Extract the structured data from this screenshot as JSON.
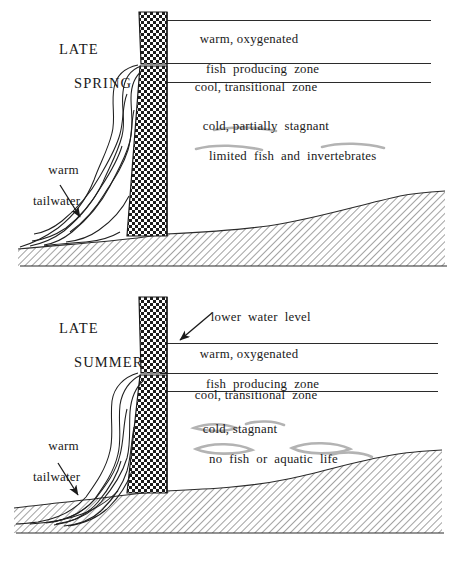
{
  "figure": {
    "colors": {
      "ink": "#1a1a1a",
      "line": "#333333",
      "hatch": "#5a5a5a",
      "stipple": "#111111",
      "smudge": "#b3b3b3",
      "background": "#ffffff"
    }
  },
  "panels": [
    {
      "id": "late-spring",
      "season_line1": "LATE",
      "season_line2": "SPRING",
      "zones": [
        {
          "id": "warm",
          "line1": "warm, oxygenated",
          "line2": "fish  producing  zone"
        },
        {
          "id": "cool",
          "line1": "cool, transitional  zone",
          "line2": ""
        },
        {
          "id": "cold",
          "line1": "cold, partially  stagnant",
          "line2": "limited  fish  and  invertebrates"
        }
      ],
      "tailwater_line1": "warm",
      "tailwater_line2": "tailwater",
      "water_level_note": ""
    },
    {
      "id": "late-summer",
      "season_line1": "LATE",
      "season_line2": "SUMMER",
      "zones": [
        {
          "id": "warm",
          "line1": "warm, oxygenated",
          "line2": "fish  producing  zone"
        },
        {
          "id": "cool",
          "line1": "cool, transitional  zone",
          "line2": ""
        },
        {
          "id": "cold",
          "line1": "cold, stagnant",
          "line2": "no  fish  or  aquatic  life"
        }
      ],
      "tailwater_line1": "warm",
      "tailwater_line2": "tailwater",
      "water_level_note": "lower  water  level"
    }
  ]
}
